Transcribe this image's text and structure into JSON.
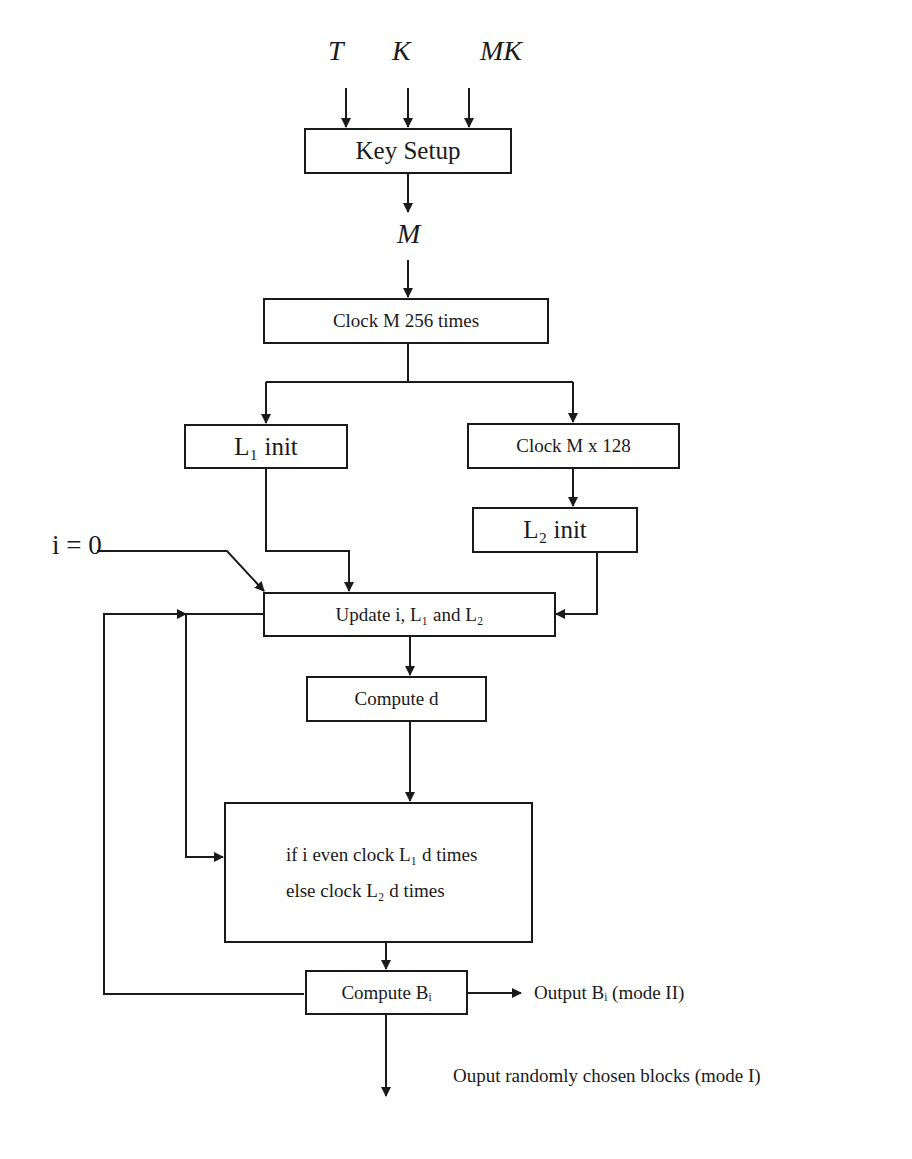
{
  "inputs": {
    "t": "T",
    "k": "K",
    "mk": "MK"
  },
  "nodes": {
    "key_setup": "Key Setup",
    "m_label": "M",
    "clock_m_256": "Clock M 256 times",
    "l1_init": "L₁ init",
    "clock_m_128": "Clock M x 128",
    "l2_init": "L₂ init",
    "i_init": "i = 0",
    "update": "Update i, L₁ and L₂",
    "compute_d": "Compute d",
    "clock_line1": "if i even clock L₁ d times",
    "clock_line2": "else clock L₂ d times",
    "compute_bi": "Compute Bᵢ"
  },
  "outputs": {
    "mode2": "Output Bᵢ (mode II)",
    "mode1": "Ouput randomly chosen blocks (mode I)"
  },
  "colors": {
    "stroke": "#1a1a1a",
    "background": "#ffffff"
  }
}
